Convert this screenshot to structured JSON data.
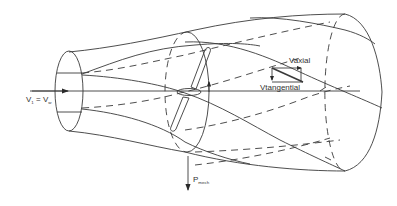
{
  "diagram": {
    "type": "wind-turbine-stream-tube",
    "labels": {
      "inlet_velocity": {
        "main": "V",
        "main_sub": "1",
        "equals": " = ",
        "rhs": "V",
        "rhs_sub": "w"
      },
      "axial_velocity": "Vaxial",
      "tangential_velocity": "Vtangential",
      "mechanical_power": {
        "main": "P",
        "sub": "mech"
      }
    },
    "colors": {
      "line": "#3a3a3a",
      "text": "#333333",
      "background": "#ffffff"
    },
    "elements": [
      "inlet-ellipse",
      "rotor-disk",
      "rotor-blades",
      "outlet-ellipse",
      "stream-tube-outline",
      "helical-wake-lines",
      "axis-line",
      "inflow-arrow",
      "power-arrow",
      "velocity-vector-triangle"
    ]
  }
}
